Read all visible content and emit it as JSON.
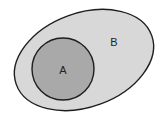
{
  "diagram": {
    "type": "euler",
    "sets": [
      {
        "id": "B",
        "label": "B",
        "shape": "ellipse",
        "fill": "#d8d8d8",
        "stroke": "#1e1e1e",
        "cx": 84,
        "cy": 60,
        "rx": 72,
        "ry": 47,
        "rotate": -20,
        "label_x": 114,
        "label_y": 46
      },
      {
        "id": "A",
        "label": "A",
        "shape": "circle",
        "fill": "#a9a9a9",
        "stroke": "#1e1e1e",
        "cx": 63,
        "cy": 69,
        "r": 31,
        "label_x": 63,
        "label_y": 74
      }
    ]
  }
}
